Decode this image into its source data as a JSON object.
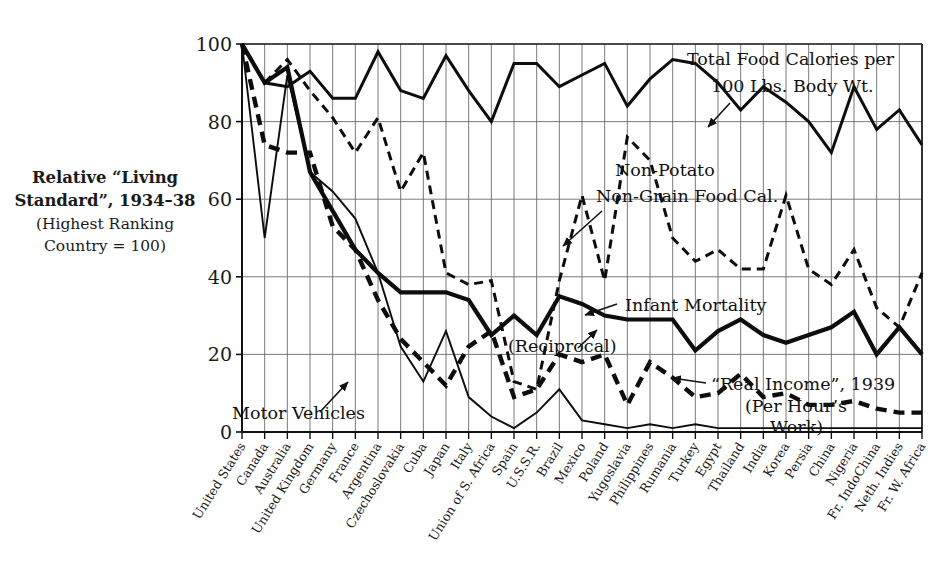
{
  "side_caption": {
    "line1": "Relative “Living",
    "line2": "Standard”, 1934–38",
    "line3": "(Highest Ranking",
    "line4": "Country = 100)"
  },
  "annotations": {
    "total_food_l1": "Total Food Calories per",
    "total_food_l2": "100 Lbs. Body Wt.",
    "non_potato_l1": "Non-Potato",
    "non_potato_l2": "Non-Grain Food Cal.",
    "infant_mortality": "Infant Mortality",
    "infant_mortality_sub": "(Reciprocal)",
    "real_income_l1": "“Real Income”, 1939",
    "real_income_l2": "(Per Hour’s",
    "real_income_l3": "Work)",
    "motor_vehicles": "Motor Vehicles"
  },
  "chart_data": {
    "type": "line",
    "title": "",
    "xlabel": "",
    "ylabel": "Relative “Living Standard”, 1934–38 (Highest Ranking Country = 100)",
    "ylim": [
      0,
      100
    ],
    "yticks": [
      0,
      20,
      40,
      60,
      80,
      100
    ],
    "grid": "vertical-and-horizontal",
    "legend": "inline-annotations",
    "categories": [
      "United States",
      "Canada",
      "Australia",
      "United Kingdom",
      "Germany",
      "France",
      "Argentina",
      "Czechoslovakia",
      "Cuba",
      "Japan",
      "Italy",
      "Union of S. Africa",
      "Spain",
      "U.S.S.R.",
      "Brazil",
      "Mexico",
      "Poland",
      "Yugoslavia",
      "Philippines",
      "Rumania",
      "Turkey",
      "Egypt",
      "Thailand",
      "India",
      "Korea",
      "Persia",
      "China",
      "Nigeria",
      "Fr. IndoChina",
      "Neth. Indies",
      "Fr. W. Africa"
    ],
    "series": [
      {
        "name": "Total Food Calories per 100 Lbs. Body Wt.",
        "style": "solid",
        "values": [
          100,
          90,
          89,
          93,
          86,
          86,
          98,
          88,
          86,
          97,
          88,
          80,
          95,
          95,
          89,
          92,
          95,
          84,
          91,
          96,
          95,
          90,
          83,
          89,
          85,
          80,
          72,
          89,
          78,
          83,
          74
        ]
      },
      {
        "name": "Non-Potato Non-Grain Food Cal.",
        "style": "dashed",
        "values": [
          100,
          90,
          96,
          88,
          81,
          72,
          81,
          62,
          72,
          41,
          38,
          39,
          13,
          11,
          39,
          61,
          39,
          76,
          70,
          50,
          44,
          47,
          42,
          42,
          61,
          42,
          38,
          47,
          32,
          27,
          41
        ]
      },
      {
        "name": "Infant Mortality (Reciprocal)",
        "style": "solid-thick",
        "values": [
          100,
          90,
          94,
          67,
          57,
          47,
          41,
          36,
          36,
          36,
          34,
          25,
          30,
          25,
          35,
          33,
          30,
          29,
          29,
          29,
          21,
          26,
          29,
          25,
          23,
          25,
          27,
          31,
          20,
          27,
          20
        ]
      },
      {
        "name": "“Real Income”, 1939 (Per Hour’s Work)",
        "style": "dashed-thick",
        "values": [
          100,
          74,
          72,
          72,
          53,
          47,
          34,
          24,
          18,
          12,
          22,
          26,
          9,
          11,
          20,
          18,
          20,
          7,
          18,
          14,
          9,
          10,
          15,
          9,
          10,
          7,
          7,
          8,
          6,
          5,
          5
        ]
      },
      {
        "name": "Motor Vehicles",
        "style": "solid-thin",
        "values": [
          100,
          50,
          92,
          67,
          62,
          55,
          41,
          22,
          13,
          26,
          9,
          4,
          1,
          5,
          11,
          3,
          2,
          1,
          2,
          1,
          2,
          1,
          1,
          1,
          1,
          1,
          1,
          1,
          1,
          1,
          1
        ]
      }
    ]
  }
}
